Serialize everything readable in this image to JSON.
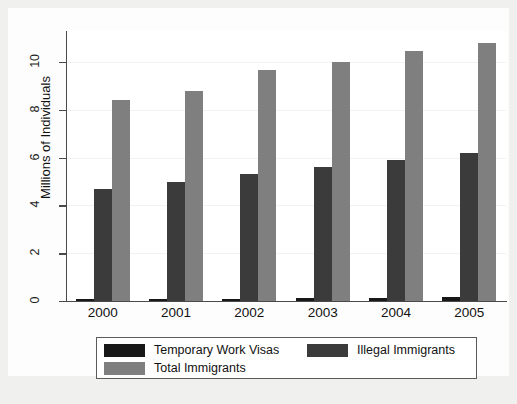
{
  "chart_data": {
    "type": "bar",
    "title": "",
    "subtitle": "",
    "xlabel": "",
    "ylabel": "Millions of Individuals",
    "categories": [
      "2000",
      "2001",
      "2002",
      "2003",
      "2004",
      "2005"
    ],
    "series": [
      {
        "name": "Temporary Work Visas",
        "color": "#181818",
        "values": [
          0.07,
          0.08,
          0.09,
          0.11,
          0.13,
          0.15
        ]
      },
      {
        "name": "Illegal Immigrants",
        "color": "#3b3b3b",
        "values": [
          4.7,
          5.0,
          5.3,
          5.6,
          5.9,
          6.2
        ]
      },
      {
        "name": "Total Immigrants",
        "color": "#7f7f7f",
        "values": [
          8.4,
          8.8,
          9.65,
          10.0,
          10.45,
          10.8
        ]
      }
    ],
    "ylim": [
      0,
      11.3
    ],
    "yticks": [
      0,
      2,
      4,
      6,
      8,
      10
    ],
    "ytick_labels": [
      "0",
      "2",
      "4",
      "6",
      "8",
      "10"
    ],
    "grid": true,
    "legend_position": "below-axes"
  },
  "legend": {
    "items": [
      {
        "label": "Temporary Work Visas",
        "swatch": "s0"
      },
      {
        "label": "Illegal Immigrants",
        "swatch": "s1"
      },
      {
        "label": "Total Immigrants",
        "swatch": "s2"
      }
    ]
  },
  "caption": {
    "remnant": ""
  }
}
